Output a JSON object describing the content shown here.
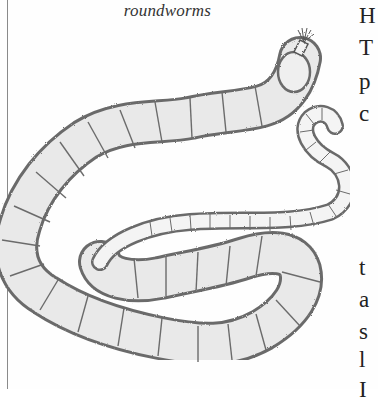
{
  "figure": {
    "caption": "roundworms",
    "style": "pencil sketch"
  },
  "text_column": {
    "fragments": [
      {
        "text": "H",
        "top": 4
      },
      {
        "text": "T",
        "top": 36
      },
      {
        "text": "p",
        "top": 70
      },
      {
        "text": "c",
        "top": 102
      },
      {
        "text": "t",
        "top": 256
      },
      {
        "text": "a",
        "top": 288
      },
      {
        "text": "s",
        "top": 320
      },
      {
        "text": "l",
        "top": 348
      },
      {
        "text": "I",
        "top": 378
      }
    ]
  },
  "colors": {
    "background": "#fefefe",
    "sketch_outline": "#6b6b6b",
    "sketch_fill": "#e6e6e6",
    "frame_line": "#8a8a8a",
    "text": "#222222"
  }
}
